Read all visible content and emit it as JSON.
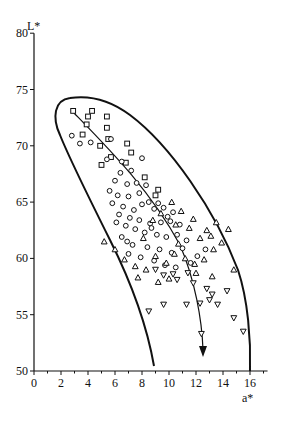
{
  "chart_data": {
    "type": "scatter",
    "title": "",
    "xlabel": "a*",
    "ylabel": "L*",
    "xlim": [
      0,
      17.3
    ],
    "ylim": [
      50,
      80
    ],
    "x_ticks": [
      0,
      2,
      4,
      6,
      8,
      10,
      12,
      14,
      16
    ],
    "x_minor_ticks": [
      1,
      3,
      5,
      7,
      9,
      11,
      13,
      15,
      17
    ],
    "y_ticks": [
      50,
      55,
      60,
      65,
      70,
      75,
      80
    ],
    "grid": false,
    "legend": null,
    "series": [
      {
        "name": "squares",
        "marker": "square",
        "points": [
          [
            2.9,
            73.1
          ],
          [
            4.3,
            73.1
          ],
          [
            4.0,
            72.6
          ],
          [
            3.9,
            71.9
          ],
          [
            3.6,
            71.0
          ],
          [
            5.4,
            72.6
          ],
          [
            5.4,
            71.6
          ],
          [
            5.5,
            70.6
          ],
          [
            6.9,
            70.2
          ],
          [
            7.2,
            69.4
          ],
          [
            5.7,
            69.0
          ],
          [
            6.8,
            68.5
          ],
          [
            8.2,
            67.2
          ],
          [
            9.2,
            66.1
          ],
          [
            9.0,
            65.6
          ],
          [
            4.9,
            70.0
          ],
          [
            5.0,
            68.3
          ]
        ]
      },
      {
        "name": "circles",
        "marker": "circle",
        "points": [
          [
            2.8,
            70.9
          ],
          [
            3.4,
            70.2
          ],
          [
            4.2,
            70.3
          ],
          [
            5.7,
            70.6
          ],
          [
            5.4,
            68.8
          ],
          [
            6.5,
            68.6
          ],
          [
            8.0,
            68.9
          ],
          [
            6.4,
            67.6
          ],
          [
            7.2,
            67.8
          ],
          [
            6.0,
            66.9
          ],
          [
            6.9,
            66.6
          ],
          [
            7.6,
            66.7
          ],
          [
            8.3,
            66.5
          ],
          [
            5.6,
            66.0
          ],
          [
            6.2,
            65.6
          ],
          [
            7.0,
            65.5
          ],
          [
            7.8,
            65.8
          ],
          [
            8.5,
            65.0
          ],
          [
            9.2,
            64.9
          ],
          [
            5.8,
            64.9
          ],
          [
            6.6,
            64.6
          ],
          [
            7.4,
            64.3
          ],
          [
            8.0,
            64.8
          ],
          [
            8.9,
            64.4
          ],
          [
            9.6,
            64.5
          ],
          [
            10.3,
            64.1
          ],
          [
            6.3,
            63.9
          ],
          [
            7.1,
            63.6
          ],
          [
            7.8,
            63.4
          ],
          [
            8.6,
            63.1
          ],
          [
            9.4,
            63.2
          ],
          [
            10.1,
            63.3
          ],
          [
            10.8,
            63.0
          ],
          [
            6.8,
            62.9
          ],
          [
            7.5,
            62.6
          ],
          [
            8.2,
            62.3
          ],
          [
            9.1,
            62.1
          ],
          [
            9.8,
            61.9
          ],
          [
            10.6,
            62.1
          ],
          [
            11.3,
            61.6
          ],
          [
            6.5,
            61.9
          ],
          [
            7.3,
            61.2
          ],
          [
            8.4,
            61.0
          ],
          [
            9.3,
            60.8
          ],
          [
            10.2,
            60.5
          ],
          [
            11.0,
            60.9
          ],
          [
            7.0,
            60.4
          ],
          [
            7.9,
            60.1
          ],
          [
            8.9,
            59.8
          ],
          [
            9.7,
            59.4
          ],
          [
            10.5,
            59.2
          ],
          [
            11.6,
            59.6
          ],
          [
            12.1,
            60.2
          ],
          [
            12.7,
            60.8
          ],
          [
            6.1,
            63.2
          ],
          [
            6.9,
            61.5
          ],
          [
            8.7,
            62.7
          ],
          [
            9.9,
            63.7
          ]
        ]
      },
      {
        "name": "triangles_up",
        "marker": "triangle-up",
        "points": [
          [
            5.2,
            61.5
          ],
          [
            6.0,
            60.8
          ],
          [
            6.7,
            59.9
          ],
          [
            7.5,
            59.3
          ],
          [
            8.3,
            59.0
          ],
          [
            9.0,
            60.2
          ],
          [
            9.8,
            59.6
          ],
          [
            10.4,
            60.4
          ],
          [
            11.2,
            60.0
          ],
          [
            11.9,
            59.5
          ],
          [
            12.6,
            59.9
          ],
          [
            13.3,
            60.8
          ],
          [
            13.9,
            61.4
          ],
          [
            12.8,
            62.5
          ],
          [
            13.5,
            63.2
          ],
          [
            11.8,
            63.5
          ],
          [
            10.9,
            64.2
          ],
          [
            10.2,
            65.0
          ],
          [
            9.4,
            64.0
          ],
          [
            8.8,
            63.4
          ],
          [
            12.3,
            61.8
          ],
          [
            13.1,
            62.0
          ],
          [
            14.4,
            62.6
          ],
          [
            11.5,
            62.7
          ],
          [
            10.7,
            61.3
          ],
          [
            12.0,
            58.7
          ],
          [
            13.2,
            58.4
          ],
          [
            7.7,
            58.3
          ],
          [
            9.2,
            57.9
          ],
          [
            10.0,
            58.2
          ],
          [
            14.8,
            59.0
          ],
          [
            8.1,
            61.8
          ],
          [
            10.5,
            63.0
          ]
        ]
      },
      {
        "name": "triangles_down",
        "marker": "triangle-down",
        "points": [
          [
            9.0,
            59.0
          ],
          [
            9.6,
            58.5
          ],
          [
            10.3,
            58.6
          ],
          [
            11.4,
            58.7
          ],
          [
            12.8,
            57.3
          ],
          [
            13.2,
            56.8
          ],
          [
            13.0,
            56.3
          ],
          [
            12.3,
            56.0
          ],
          [
            13.6,
            55.9
          ],
          [
            14.3,
            57.1
          ],
          [
            11.3,
            55.9
          ],
          [
            9.6,
            55.9
          ],
          [
            8.5,
            55.3
          ],
          [
            14.8,
            54.7
          ],
          [
            15.5,
            53.5
          ],
          [
            12.4,
            53.3
          ],
          [
            10.6,
            58.1
          ],
          [
            11.8,
            57.8
          ]
        ]
      }
    ],
    "annotations": [
      {
        "type": "envelope",
        "description": "closed-top boundary curve enclosing the points, from a*≈8.9 at L*=50 up the left side to a rounded top near L*≈74.3 at a*≈2.5–4.5, then down the right side to a*≈16 at L*=50"
      },
      {
        "type": "arrow",
        "description": "trend arrow from (a*≈3.0, L*≈72.8) curving down to (a*≈12.4, L*≈51.5)"
      }
    ]
  }
}
